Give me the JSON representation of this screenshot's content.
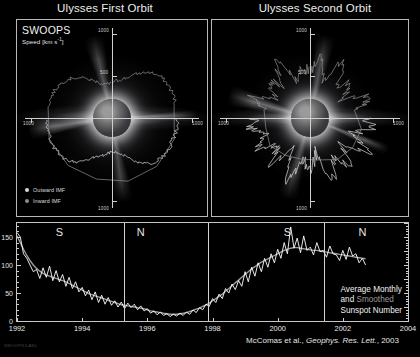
{
  "figure": {
    "titles": {
      "left": "Ulysses First Orbit",
      "right": "Ulysses Second Orbit"
    },
    "instrument_label": "SWOOPS",
    "speed_axis_label": "Speed [km s",
    "speed_axis_exponent": "-1",
    "speed_axis_label_close": "]",
    "legend": [
      {
        "id": "outward-imf",
        "label": "Outward IMF",
        "color": "#d8d8d8"
      },
      {
        "id": "inward-imf",
        "label": "Inward IMF",
        "color": "#8e8e8e"
      }
    ],
    "polar_radial_ticks": [
      "1000",
      "500",
      "1000",
      "1000",
      "1000"
    ],
    "annotation": {
      "line1": "Average Monthly",
      "line2_a": "and ",
      "line2_b": "Smoothed",
      "line3": "Sunspot Number",
      "smoothed_color": "#9b9b9b"
    },
    "credit": {
      "authors": "McComas et al., ",
      "journal": "Geophys. Res. Lett.",
      "year": ", 2003"
    },
    "watermark": "SWOOPS/LANL"
  },
  "chart_data": [
    {
      "type": "line",
      "subtype": "polar",
      "title": "Ulysses First Orbit",
      "description": "Solar wind speed vs heliographic latitude during Ulysses first polar orbit (solar minimum), plotted radially around an image of the Sun.",
      "rlabel": "Speed [km s^-1]",
      "rlim": [
        0,
        1000
      ],
      "rticks": [
        500,
        1000
      ],
      "grid": false,
      "note": "Fast wind ~750 km/s over both poles, slow variable wind ~350-450 km/s near the equator.",
      "series": [
        {
          "name": "Outward IMF",
          "color": "#d8d8d8",
          "theta_deg": [
            90,
            100,
            110,
            120,
            130,
            140,
            150,
            160,
            170,
            180,
            190,
            200,
            210,
            220,
            230,
            240,
            250,
            260,
            270
          ],
          "r_km_s": [
            760,
            770,
            755,
            765,
            745,
            700,
            600,
            470,
            420,
            400,
            430,
            480,
            560,
            680,
            740,
            760,
            765,
            755,
            770
          ]
        },
        {
          "name": "Inward IMF",
          "color": "#8e8e8e",
          "theta_deg": [
            0,
            10,
            20,
            30,
            40,
            50,
            60,
            70,
            80,
            280,
            290,
            300,
            310,
            320,
            330,
            340,
            350,
            360
          ],
          "r_km_s": [
            420,
            450,
            500,
            600,
            700,
            750,
            765,
            770,
            760,
            765,
            755,
            740,
            700,
            620,
            520,
            440,
            400,
            420
          ]
        }
      ]
    },
    {
      "type": "line",
      "subtype": "polar",
      "title": "Ulysses Second Orbit",
      "description": "Solar wind speed vs heliographic latitude during Ulysses second polar orbit (solar maximum), plotted radially around an image of the Sun.",
      "rlabel": "Speed [km s^-1]",
      "rlim": [
        0,
        1000
      ],
      "rticks": [
        500,
        1000
      ],
      "grid": false,
      "note": "Highly variable speed at all latitudes, 350-800 km/s, with no ordered fast polar flow.",
      "series": [
        {
          "name": "Outward IMF",
          "color": "#d8d8d8",
          "theta_deg": [
            90,
            100,
            110,
            120,
            130,
            140,
            150,
            160,
            170,
            180,
            190,
            200,
            210,
            220,
            230,
            240,
            250,
            260,
            270
          ],
          "r_km_s": [
            640,
            720,
            480,
            760,
            430,
            690,
            520,
            780,
            400,
            600,
            470,
            740,
            380,
            660,
            450,
            720,
            500,
            690,
            610
          ]
        },
        {
          "name": "Inward IMF",
          "color": "#8e8e8e",
          "theta_deg": [
            0,
            10,
            20,
            30,
            40,
            50,
            60,
            70,
            80,
            280,
            290,
            300,
            310,
            320,
            330,
            340,
            350,
            360
          ],
          "r_km_s": [
            520,
            700,
            420,
            760,
            480,
            640,
            390,
            730,
            560,
            470,
            700,
            410,
            650,
            500,
            760,
            430,
            600,
            520
          ]
        }
      ]
    },
    {
      "type": "line",
      "title": "Average Monthly and Smoothed Sunspot Number",
      "xlabel": "",
      "ylabel": "Sunspot Number",
      "xlim": [
        1992.0,
        2004.0
      ],
      "ylim": [
        0,
        175
      ],
      "xticks": [
        1992,
        1994,
        1996,
        1998,
        2000,
        2002,
        2004
      ],
      "yticks": [
        0,
        50,
        100,
        150
      ],
      "grid": false,
      "legend_position": "bottom-right",
      "pole_markers": [
        {
          "label": "S",
          "x": 1993.3
        },
        {
          "label": "N",
          "x": 1995.8
        },
        {
          "label": "S",
          "x": 2000.3
        },
        {
          "label": "N",
          "x": 2002.6
        }
      ],
      "pole_divider_x": [
        1995.28,
        1997.85,
        2001.42
      ],
      "x": [
        1992.0,
        1992.1,
        1992.2,
        1992.3,
        1992.4,
        1992.5,
        1992.6,
        1992.7,
        1992.8,
        1992.9,
        1993.0,
        1993.1,
        1993.2,
        1993.3,
        1993.4,
        1993.5,
        1993.6,
        1993.7,
        1993.8,
        1993.9,
        1994.0,
        1994.1,
        1994.2,
        1994.3,
        1994.4,
        1994.5,
        1994.6,
        1994.7,
        1994.8,
        1994.9,
        1995.0,
        1995.1,
        1995.2,
        1995.3,
        1995.4,
        1995.5,
        1995.6,
        1995.7,
        1995.8,
        1995.9,
        1996.0,
        1996.1,
        1996.2,
        1996.3,
        1996.4,
        1996.5,
        1996.6,
        1996.7,
        1996.8,
        1996.9,
        1997.0,
        1997.1,
        1997.2,
        1997.3,
        1997.4,
        1997.5,
        1997.6,
        1997.7,
        1997.8,
        1997.9,
        1998.0,
        1998.1,
        1998.2,
        1998.3,
        1998.4,
        1998.5,
        1998.6,
        1998.7,
        1998.8,
        1998.9,
        1999.0,
        1999.1,
        1999.2,
        1999.3,
        1999.4,
        1999.5,
        1999.6,
        1999.7,
        1999.8,
        1999.9,
        2000.0,
        2000.1,
        2000.2,
        2000.3,
        2000.4,
        2000.5,
        2000.6,
        2000.7,
        2000.8,
        2000.9,
        2001.0,
        2001.1,
        2001.2,
        2001.3,
        2001.4,
        2001.5,
        2001.6,
        2001.7,
        2001.8,
        2001.9,
        2002.0,
        2002.1,
        2002.2,
        2002.3,
        2002.4,
        2002.5,
        2002.6,
        2002.7
      ],
      "series": [
        {
          "name": "Average Monthly",
          "color": "#ffffff",
          "values": [
            158,
            150,
            120,
            112,
            100,
            88,
            92,
            76,
            95,
            78,
            98,
            72,
            90,
            70,
            83,
            62,
            78,
            58,
            70,
            52,
            60,
            45,
            55,
            38,
            52,
            33,
            46,
            30,
            42,
            28,
            36,
            25,
            34,
            22,
            32,
            24,
            30,
            20,
            27,
            18,
            22,
            14,
            18,
            11,
            16,
            10,
            13,
            8,
            12,
            9,
            14,
            10,
            16,
            12,
            20,
            15,
            24,
            20,
            30,
            26,
            40,
            33,
            48,
            40,
            58,
            50,
            66,
            56,
            72,
            62,
            88,
            70,
            96,
            80,
            104,
            88,
            112,
            96,
            120,
            104,
            128,
            112,
            140,
            120,
            168,
            130,
            148,
            122,
            152,
            126,
            132,
            118,
            140,
            124,
            126,
            114,
            134,
            120,
            118,
            108,
            126,
            110,
            132,
            116,
            120,
            104,
            112,
            100
          ]
        },
        {
          "name": "Smoothed",
          "color": "#9b9b9b",
          "values": [
            152,
            140,
            128,
            117,
            108,
            100,
            94,
            89,
            85,
            82,
            80,
            78,
            76,
            74,
            72,
            70,
            67,
            64,
            61,
            58,
            55,
            52,
            49,
            47,
            45,
            43,
            41,
            39,
            37,
            35,
            33,
            31,
            29,
            28,
            27,
            26,
            25,
            24,
            23,
            22,
            20,
            18,
            17,
            16,
            15,
            14,
            13,
            12,
            12,
            12,
            13,
            14,
            15,
            17,
            19,
            21,
            23,
            26,
            29,
            32,
            36,
            40,
            44,
            48,
            53,
            58,
            63,
            68,
            73,
            78,
            83,
            88,
            93,
            97,
            101,
            105,
            108,
            111,
            114,
            117,
            120,
            123,
            126,
            128,
            130,
            131,
            131,
            130,
            129,
            128,
            127,
            126,
            126,
            125,
            124,
            123,
            122,
            121,
            120,
            119,
            118,
            117,
            116,
            115,
            114,
            113,
            112,
            111
          ]
        }
      ]
    }
  ]
}
